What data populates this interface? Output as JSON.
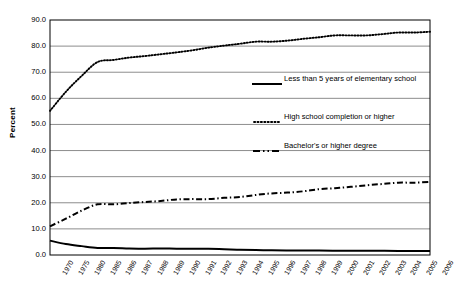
{
  "chart_data": {
    "type": "line",
    "title": "",
    "xlabel": "",
    "ylabel": "Percent",
    "ylim": [
      0.0,
      90.0
    ],
    "ytick_step": 10.0,
    "grid": true,
    "legend_position": "inside-right",
    "y_ticks": [
      "0.0",
      "10.0",
      "20.0",
      "30.0",
      "40.0",
      "50.0",
      "60.0",
      "70.0",
      "80.0",
      "90.0"
    ],
    "categories": [
      "1970",
      "1975",
      "1980",
      "1985",
      "1986",
      "1987",
      "1988",
      "1989",
      "1990",
      "1991",
      "1992",
      "1993",
      "1994",
      "1995",
      "1996",
      "1997",
      "1998",
      "1999",
      "2000",
      "2001",
      "2002",
      "2003",
      "2004",
      "2005",
      "2006"
    ],
    "series": [
      {
        "name": "Less than 5 years of elementary school",
        "style": "solid",
        "color": "#000000",
        "values": [
          5.5,
          4.2,
          3.4,
          2.7,
          2.7,
          2.5,
          2.4,
          2.5,
          2.4,
          2.4,
          2.4,
          2.2,
          2.0,
          1.9,
          1.8,
          1.7,
          1.7,
          1.7,
          1.6,
          1.6,
          1.6,
          1.6,
          1.5,
          1.5,
          1.5
        ]
      },
      {
        "name": "High school completion or higher",
        "style": "dotted",
        "color": "#000000",
        "values": [
          55.2,
          62.5,
          68.6,
          73.9,
          74.7,
          75.6,
          76.2,
          76.9,
          77.6,
          78.4,
          79.4,
          80.2,
          80.9,
          81.7,
          81.7,
          82.1,
          82.8,
          83.4,
          84.1,
          84.1,
          84.1,
          84.6,
          85.2,
          85.2,
          85.5
        ]
      },
      {
        "name": "Bachelor's or higher degree",
        "style": "dashdot",
        "color": "#000000",
        "values": [
          11.0,
          13.9,
          17.0,
          19.4,
          19.4,
          19.9,
          20.3,
          20.7,
          21.3,
          21.4,
          21.4,
          21.9,
          22.2,
          23.0,
          23.6,
          23.9,
          24.4,
          25.2,
          25.6,
          26.1,
          26.7,
          27.2,
          27.7,
          27.7,
          28.0
        ]
      }
    ],
    "legend_entries": [
      {
        "label": "Less than 5 years of elementary school",
        "style": "solid"
      },
      {
        "label": "High school completion or higher",
        "style": "dotted"
      },
      {
        "label": "Bachelor's or higher degree",
        "style": "dashdot"
      }
    ]
  },
  "colors": {
    "line": "#000000",
    "grid": "#808080",
    "axis": "#000000",
    "background": "#ffffff"
  }
}
